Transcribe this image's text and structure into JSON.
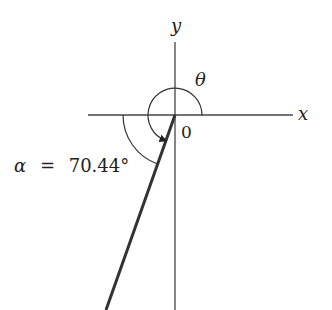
{
  "diagram": {
    "type": "angle-in-standard-position",
    "axes": {
      "x_label": "x",
      "y_label": "y",
      "origin_label": "0"
    },
    "angles": {
      "theta_label": "θ",
      "alpha_label": "α = 70.44°",
      "alpha_symbol": "α",
      "alpha_value": "70.44°"
    },
    "colors": {
      "axis": "#333333",
      "terminal_side": "#333333",
      "text": "#222222",
      "background": "#ffffff"
    }
  }
}
